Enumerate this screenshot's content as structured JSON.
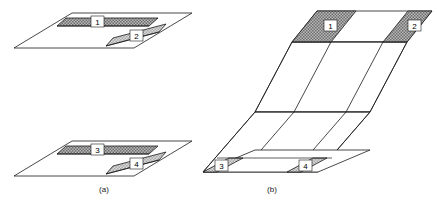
{
  "figure": {
    "type": "technical-line-diagram",
    "background_color": "#ffffff",
    "line_color": "#1a1a1a"
  },
  "captions": [
    {
      "id": "a",
      "label": "(a)",
      "x": 104,
      "y": 192
    },
    {
      "id": "b",
      "label": "(b)",
      "x": 272,
      "y": 192
    }
  ],
  "panel_a": {
    "name": "flat-sheets-panel",
    "sheets": [
      {
        "id": "upper-sheet",
        "outline": "14,48 72,13 192,13 134,48",
        "cells": [
          {
            "id": "cell-1",
            "label": "1",
            "shade": "dark",
            "polygon": "66,18 158,18 149,26 57,26",
            "label_x": 98,
            "label_y": 24
          },
          {
            "id": "cell-2",
            "label": "2",
            "shade": "light",
            "polygon": "113,38 166,24 159,32 106,46",
            "label_x": 136,
            "label_y": 38
          }
        ],
        "fold_lines": [
          "57,26 149,26",
          "106,46 159,32"
        ]
      },
      {
        "id": "lower-sheet",
        "outline": "14,176 72,141 192,141 134,176",
        "cells": [
          {
            "id": "cell-3",
            "label": "3",
            "shade": "dark",
            "polygon": "66,146 158,146 149,154 57,154",
            "label_x": 98,
            "label_y": 152
          },
          {
            "id": "cell-4",
            "label": "4",
            "shade": "light",
            "polygon": "113,166 166,152 159,160 106,174",
            "label_x": 136,
            "label_y": 166
          }
        ],
        "fold_lines": [
          "57,154 149,154",
          "106,174 159,160"
        ]
      }
    ]
  },
  "panel_b": {
    "name": "bent-sheet-panel",
    "top_face": {
      "id": "top-band",
      "outline": "317,11 432,11 407,42 292,42",
      "cells": [
        {
          "id": "cell-1b",
          "label": "1",
          "shade": "dark",
          "polygon": "317,11 356,11 331,42 292,42",
          "label_x": 330,
          "label_y": 28
        },
        {
          "id": "cell-2b",
          "label": "2",
          "shade": "dark",
          "polygon": "408,11 432,11 407,42 383,42",
          "label_x": 414,
          "label_y": 28
        }
      ]
    },
    "bottom_face": {
      "id": "bottom-band",
      "outline": "203,172 325,150 336,150 214,172",
      "cells": [
        {
          "id": "cell-3b",
          "label": "3",
          "shade": "light",
          "polygon": "203,172 229,158 243,158 217,172",
          "label_x": 222,
          "label_y": 166
        },
        {
          "id": "cell-4b",
          "label": "4",
          "shade": "light",
          "polygon": "287,172 313,158 327,158 301,172",
          "label_x": 306,
          "label_y": 166
        }
      ]
    },
    "fold_edges": [
      "292,42 255,112",
      "331,42 294,112",
      "383,42 346,112",
      "407,42 370,112",
      "255,112 203,172",
      "294,112 242,172",
      "346,112 294,172",
      "370,112 318,172"
    ],
    "crease_lines": [
      "255,112 370,112",
      "292,42 407,42",
      "203,172 318,172"
    ]
  }
}
